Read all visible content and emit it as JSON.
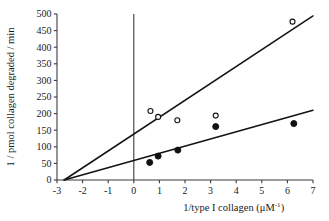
{
  "chart_data": {
    "type": "scatter",
    "title": "",
    "subtitle": "",
    "xlabel": "1/type I collagen (μM⁻¹)",
    "xlabel_base": "1/type I collagen (μM",
    "xlabel_sup": "-1",
    "xlabel_tail": ")",
    "ylabel": "1 / pmol collagen degraded / min",
    "xlim": [
      -3,
      7
    ],
    "ylim": [
      0,
      500
    ],
    "xticks": [
      -3,
      -2,
      -1,
      0,
      1,
      2,
      3,
      4,
      5,
      6,
      7
    ],
    "xticklabels": [
      "-3",
      "-2",
      "-1",
      "0",
      "1",
      "2",
      "3",
      "4",
      "5",
      "6",
      "7"
    ],
    "yticks": [
      0,
      50,
      100,
      150,
      200,
      250,
      300,
      350,
      400,
      450,
      500
    ],
    "yticklabels": [
      "0",
      "50",
      "100",
      "150",
      "200",
      "250",
      "300",
      "350",
      "400",
      "450",
      "500"
    ],
    "grid": false,
    "legend_position": "none",
    "vertical_reference_line_x": 0,
    "series": [
      {
        "name": "open-circles",
        "marker": "open-circle",
        "color": "#111111",
        "points": [
          {
            "x": 0.65,
            "y": 208
          },
          {
            "x": 0.95,
            "y": 190
          },
          {
            "x": 1.7,
            "y": 180
          },
          {
            "x": 3.2,
            "y": 194
          },
          {
            "x": 6.2,
            "y": 477
          }
        ],
        "fit_line": {
          "x_intercept": -2.72,
          "x_start": -2.72,
          "y_start": 0,
          "x_end": 7.0,
          "y_end": 494
        }
      },
      {
        "name": "filled-circles",
        "marker": "filled-circle",
        "color": "#111111",
        "points": [
          {
            "x": 0.62,
            "y": 53
          },
          {
            "x": 0.95,
            "y": 72
          },
          {
            "x": 1.72,
            "y": 90
          },
          {
            "x": 3.2,
            "y": 161
          },
          {
            "x": 6.25,
            "y": 170
          }
        ],
        "fit_line": {
          "x_intercept": -2.72,
          "x_start": -2.72,
          "y_start": 0,
          "x_end": 7.0,
          "y_end": 210
        }
      }
    ]
  }
}
